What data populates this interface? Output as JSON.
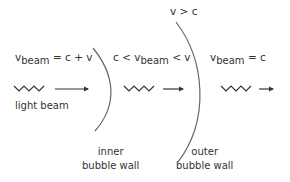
{
  "diagram": {
    "top_label": "v > c",
    "regions": [
      {
        "v": "v",
        "sub": "beam",
        "rel": " = c + v"
      },
      {
        "pre": "c < v",
        "sub": "beam",
        "rel": " < v"
      },
      {
        "v": "v",
        "sub": "beam",
        "rel": " = c"
      }
    ],
    "light_beam_label": "light beam",
    "inner_wall_label": [
      "inner",
      "bubble wall"
    ],
    "outer_wall_label": [
      "outer",
      "bubble wall"
    ],
    "colors": {
      "stroke": "#555555",
      "text": "#333333"
    }
  }
}
